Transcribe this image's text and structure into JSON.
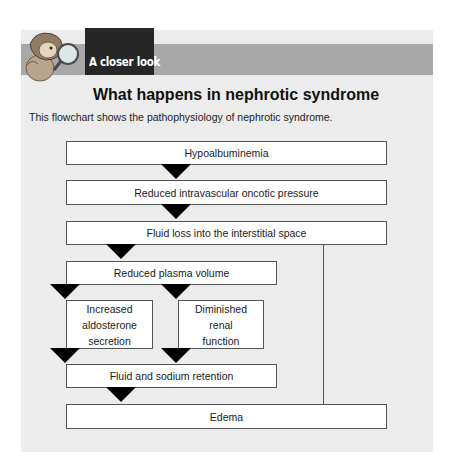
{
  "header": {
    "section_tag": "A closer look",
    "mascot_icon": "character-with-magnifying-glass-icon"
  },
  "title": "What happens in nephrotic syndrome",
  "subtitle": "This flowchart shows the pathophysiology of nephrotic syndrome.",
  "flowchart": {
    "nodes": [
      {
        "id": "n1",
        "label": "Hypoalbuminemia"
      },
      {
        "id": "n2",
        "label": "Reduced intravascular oncotic pressure"
      },
      {
        "id": "n3",
        "label": "Fluid loss into the interstitial space"
      },
      {
        "id": "n4",
        "label": "Reduced plasma volume"
      },
      {
        "id": "n5a",
        "label": "Increased aldosterone secretion",
        "lines": [
          "Increased",
          "aldosterone",
          "secretion"
        ]
      },
      {
        "id": "n5b",
        "label": "Diminished renal function",
        "lines": [
          "Diminished",
          "renal",
          "function"
        ]
      },
      {
        "id": "n6",
        "label": "Fluid and sodium retention"
      },
      {
        "id": "n7",
        "label": "Edema"
      }
    ],
    "edges": [
      [
        "n1",
        "n2"
      ],
      [
        "n2",
        "n3"
      ],
      [
        "n3",
        "n4"
      ],
      [
        "n3",
        "n7"
      ],
      [
        "n4",
        "n5a"
      ],
      [
        "n4",
        "n5b"
      ],
      [
        "n5a",
        "n6"
      ],
      [
        "n5b",
        "n6"
      ],
      [
        "n6",
        "n7"
      ]
    ]
  },
  "colors": {
    "panel_bg": "#ececec",
    "header_band": "#a8a8a8",
    "tag_bg": "#262626",
    "arrow": "#000000",
    "box_bg": "#ffffff"
  }
}
